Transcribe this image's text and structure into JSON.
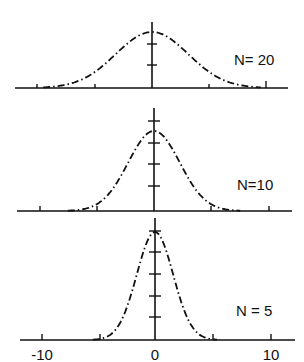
{
  "chart_data": {
    "type": "line",
    "title": "",
    "xlabel": "",
    "ylabel": "",
    "xlim": [
      -12,
      12
    ],
    "x_ticks": [
      -10,
      -5,
      0,
      5,
      10
    ],
    "x_tick_labels": [
      "-10",
      "0",
      "10"
    ],
    "grid": false,
    "legend": "none",
    "line_style": "dash-dot",
    "panels": [
      {
        "label": "N= 20",
        "N": 20,
        "distribution": "gaussian",
        "mean": 0,
        "sigma": 3.16,
        "relative_peak": 0.56,
        "y_ticks_count": 2
      },
      {
        "label": "N=10",
        "N": 10,
        "distribution": "gaussian",
        "mean": 0,
        "sigma": 2.24,
        "relative_peak": 0.8,
        "y_ticks_count": 4
      },
      {
        "label": "N = 5",
        "N": 5,
        "distribution": "gaussian",
        "mean": 0,
        "sigma": 1.58,
        "relative_peak": 1.08,
        "y_ticks_count": 5
      }
    ]
  },
  "labels": {
    "panel_1": "N= 20",
    "panel_2": "N=10",
    "panel_3": "N = 5",
    "x_tick_neg10": "-10",
    "x_tick_0": "0",
    "x_tick_10": "10"
  }
}
